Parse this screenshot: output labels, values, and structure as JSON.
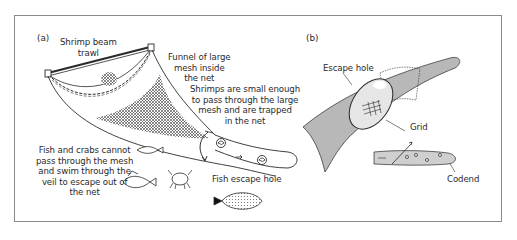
{
  "figure": {
    "panels": [
      {
        "id": "a",
        "tag": "(a)",
        "labels": {
          "trawl": [
            "Shrimp beam",
            "trawl"
          ],
          "funnel": [
            "Funnel of large",
            "mesh inside",
            "the net"
          ],
          "shrimps": [
            "Shrimps are small enough",
            "to pass through the large",
            "mesh and are trapped",
            "in the net"
          ],
          "fish_crabs": [
            "Fish and crabs cannot",
            "pass through the mesh",
            "and swim through the",
            "veil to escape out of",
            "the net"
          ],
          "escape_hole": "Fish escape hole"
        }
      },
      {
        "id": "b",
        "tag": "(b)",
        "labels": {
          "escape_hole": "Escape hole",
          "grid": "Grid",
          "codend": "Codend"
        }
      }
    ],
    "colors": {
      "line": "#2a2a2a",
      "net_fill": "#b8b8b8",
      "frame": "#8a8a8a",
      "grid_hole": "#e6e6e6"
    }
  }
}
